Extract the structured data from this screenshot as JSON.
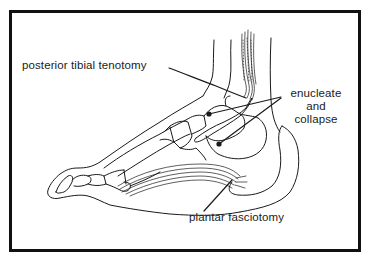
{
  "figure": {
    "stroke_color": "#1a1a1a",
    "frame_color": "#111111",
    "background": "#ffffff"
  },
  "labels": {
    "posterior_tibial": "posterior tibial tenotomy",
    "enucleate_line1": "enucleate",
    "enucleate_line2": "and",
    "enucleate_line3": "collapse",
    "plantar": "plantar fasciotomy"
  }
}
